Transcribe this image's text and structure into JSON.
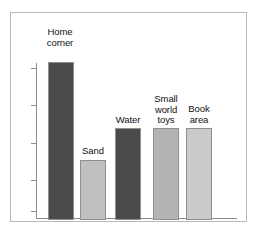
{
  "chart_data": {
    "type": "bar",
    "title": "",
    "subtitle": "",
    "xlabel": "",
    "ylabel": "",
    "categories": [
      "Home corner",
      "Sand",
      "Water",
      "Small world toys",
      "Book area"
    ],
    "values": [
      100,
      38,
      58,
      58,
      58
    ],
    "ylim": [
      0,
      100
    ],
    "grid": false,
    "legend": false,
    "legend_position": "none",
    "axis_tick_labels": [],
    "bar_colors": [
      "#4a4a4a",
      "#c0c0c0",
      "#4a4a4a",
      "#b4b4b4",
      "#cacaca"
    ],
    "series": [
      {
        "name": "",
        "values": [
          100,
          38,
          58,
          58,
          58
        ]
      }
    ]
  },
  "bars": [
    {
      "label": "Home\ncorner",
      "category": "Home corner",
      "value": 100,
      "color": "#4a4a4a",
      "left": 12,
      "width": 26,
      "height_pct": 100,
      "label_left": -2,
      "label_top": -32,
      "label_width": 52
    },
    {
      "label": "Sand",
      "category": "Sand",
      "value": 38,
      "color": "#c0c0c0",
      "left": 44,
      "width": 26,
      "height_pct": 38,
      "label_left": 31,
      "label_top": 87,
      "label_width": 52
    },
    {
      "label": "Water",
      "category": "Water",
      "value": 58,
      "color": "#4a4a4a",
      "left": 79,
      "width": 26,
      "height_pct": 58,
      "label_left": 66,
      "label_top": 56,
      "label_width": 52
    },
    {
      "label": "Small\nworld\ntoys",
      "category": "Small world toys",
      "value": 58,
      "color": "#b4b4b4",
      "left": 117,
      "width": 26,
      "height_pct": 58,
      "label_left": 104,
      "label_top": 35,
      "label_width": 52
    },
    {
      "label": "Book\narea",
      "category": "Book area",
      "value": 58,
      "color": "#cacaca",
      "left": 150,
      "width": 26,
      "height_pct": 58,
      "label_left": 137,
      "label_top": 45,
      "label_width": 52
    }
  ],
  "axis": {
    "tick_positions_pct": [
      3,
      27,
      51,
      75,
      95
    ]
  },
  "colors": {
    "bar_dark": "#4a4a4a",
    "bar_light": "#c0c0c0",
    "bar_medium": "#b4b4b4",
    "bar_lightest": "#cacaca",
    "axis": "#8d8d8d",
    "frame": "#b9b9b9",
    "text": "#111111",
    "background": "#ffffff"
  }
}
